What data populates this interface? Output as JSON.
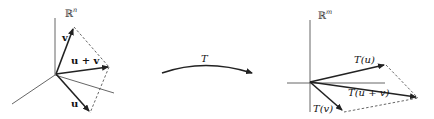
{
  "diagram": {
    "domain": {
      "space_label": "ℝ",
      "space_sup": "n",
      "vectors": {
        "v": "v",
        "u_plus_v": "u + v",
        "u": "u"
      }
    },
    "mapping": {
      "label": "T"
    },
    "codomain": {
      "space_label": "ℝ",
      "space_sup": "m",
      "vectors": {
        "Tu": "T(u)",
        "Tu_plus_v": "T(u + v)",
        "Tv": "T(v)"
      }
    },
    "colors": {
      "vector": "#222222",
      "axis": "#555555",
      "background": "#ffffff"
    }
  }
}
